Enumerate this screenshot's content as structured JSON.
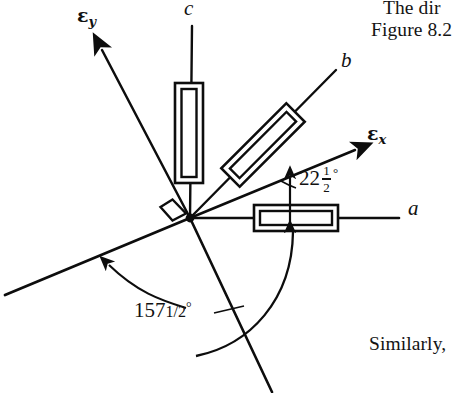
{
  "figure": {
    "origin": {
      "x": 190,
      "y": 218
    },
    "axes": [
      {
        "name": "a",
        "label": "a",
        "kind": "material-axis",
        "direction_deg": 0,
        "label_pos": {
          "x": 408,
          "y": 207
        }
      },
      {
        "name": "b",
        "label": "b",
        "kind": "material-axis",
        "direction_deg": 45,
        "label_pos": {
          "x": 341,
          "y": 58
        }
      },
      {
        "name": "c",
        "label": "c",
        "kind": "material-axis",
        "direction_deg": 90,
        "label_pos": {
          "x": 184,
          "y": 2
        }
      },
      {
        "name": "epsilon-x",
        "label": "ε",
        "sub": "x",
        "kind": "principal-axis",
        "direction_deg": 22.5,
        "label_pos": {
          "x": 369,
          "y": 126
        }
      },
      {
        "name": "epsilon-y",
        "label": "ε",
        "sub": "y",
        "kind": "principal-axis",
        "direction_deg": 112.5,
        "label_pos": {
          "x": 79,
          "y": 8
        }
      }
    ],
    "gauges": [
      {
        "name": "gauge-c",
        "along": "c",
        "angle_deg": 90
      },
      {
        "name": "gauge-b",
        "along": "b",
        "angle_deg": 45
      },
      {
        "name": "gauge-a",
        "along": "a",
        "angle_deg": 0
      }
    ],
    "annotations": {
      "angle_small": {
        "whole": "22",
        "numerator": "1",
        "denominator": "2",
        "degree": "°",
        "value_deg": 22.5,
        "from_axis": "a",
        "to_axis": "epsilon-x",
        "pos": {
          "x": 300,
          "y": 166
        }
      },
      "angle_large": {
        "text": "157",
        "half": "1/2",
        "degree": "°",
        "value_deg": 157.5,
        "from_axis": "a",
        "to_axis": "epsilon-y",
        "pos": {
          "x": 136,
          "y": 302
        }
      },
      "right_angle_marker": {
        "name": "right-angle-square",
        "between": [
          "epsilon-x",
          "epsilon-y"
        ],
        "pos": {
          "x": 170,
          "y": 206
        }
      }
    }
  },
  "page_text": {
    "top_line_1": "The dir",
    "top_line_2": "Figure 8.2",
    "bottom_line": "Similarly,"
  },
  "colors": {
    "ink": "#111111",
    "page": "#ffffff",
    "line": "#0d0d0d"
  }
}
